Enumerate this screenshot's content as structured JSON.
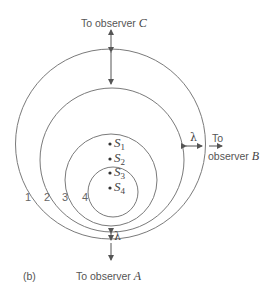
{
  "figure": {
    "panel_label": "(b)",
    "observers": {
      "A": {
        "prefix": "To  observer",
        "letter": "A"
      },
      "B": {
        "line1": "To",
        "line2": "observer",
        "letter": "B"
      },
      "C": {
        "prefix": "To observer",
        "letter": "C"
      }
    },
    "wavelength_symbol": "λ",
    "wavefront_labels": [
      "1",
      "2",
      "3",
      "4"
    ],
    "sources": [
      {
        "symbol": "S",
        "sub": "1"
      },
      {
        "symbol": "S",
        "sub": "2"
      },
      {
        "symbol": "S",
        "sub": "3"
      },
      {
        "symbol": "S",
        "sub": "4"
      }
    ],
    "colors": {
      "line": "#7a7a7a",
      "text": "#555555"
    }
  }
}
